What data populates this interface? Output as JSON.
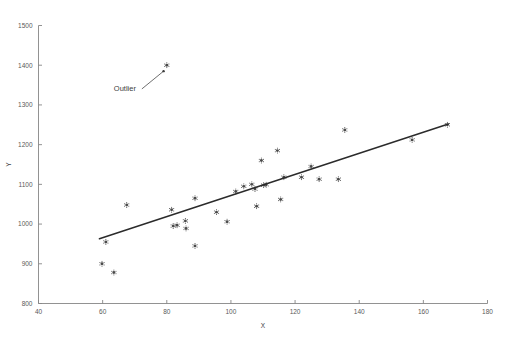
{
  "chart_data": {
    "type": "scatter",
    "title": "",
    "xlabel": "X",
    "ylabel": "Y",
    "xlim": [
      40,
      180
    ],
    "ylim": [
      800,
      1500
    ],
    "xticks": [
      40,
      60,
      80,
      100,
      120,
      140,
      160,
      180
    ],
    "yticks": [
      800,
      900,
      1000,
      1100,
      1200,
      1300,
      1400,
      1500
    ],
    "xtick_labels": [
      "40",
      "60",
      "80",
      "100",
      "120",
      "140",
      "160",
      "180"
    ],
    "ytick_labels": [
      "800",
      "900",
      "1000",
      "1100",
      "1200",
      "1300",
      "1400",
      "1500"
    ],
    "grid": false,
    "legend": null,
    "marker_color": "#4a4a4a",
    "line_color": "#2b2b2b",
    "axis_color": "#868686",
    "points": [
      [
        59.8,
        900
      ],
      [
        61.0,
        955
      ],
      [
        63.5,
        878
      ],
      [
        67.5,
        1048
      ],
      [
        80.0,
        1400
      ],
      [
        81.5,
        1036
      ],
      [
        82.0,
        995
      ],
      [
        83.2,
        997
      ],
      [
        85.8,
        1008
      ],
      [
        86.0,
        989
      ],
      [
        88.8,
        945
      ],
      [
        88.8,
        1065
      ],
      [
        95.5,
        1030
      ],
      [
        98.8,
        1006
      ],
      [
        101.5,
        1082
      ],
      [
        104.0,
        1095
      ],
      [
        106.5,
        1100
      ],
      [
        107.5,
        1088
      ],
      [
        108.0,
        1045
      ],
      [
        109.5,
        1160
      ],
      [
        110.2,
        1098
      ],
      [
        111.0,
        1099
      ],
      [
        114.5,
        1185
      ],
      [
        115.5,
        1062
      ],
      [
        116.5,
        1118
      ],
      [
        122.0,
        1118
      ],
      [
        125.0,
        1145
      ],
      [
        127.5,
        1113
      ],
      [
        133.5,
        1113
      ],
      [
        135.5,
        1237
      ],
      [
        156.5,
        1212
      ],
      [
        167.5,
        1250
      ]
    ],
    "fit_line": {
      "x_start": 59.0,
      "y_start": 963,
      "x_end": 167.8,
      "y_end": 1252
    },
    "annotations": [
      {
        "text": "Outlier",
        "label_x": 63.5,
        "label_y": 1334,
        "point_x": 79.0,
        "point_y": 1385
      }
    ]
  }
}
